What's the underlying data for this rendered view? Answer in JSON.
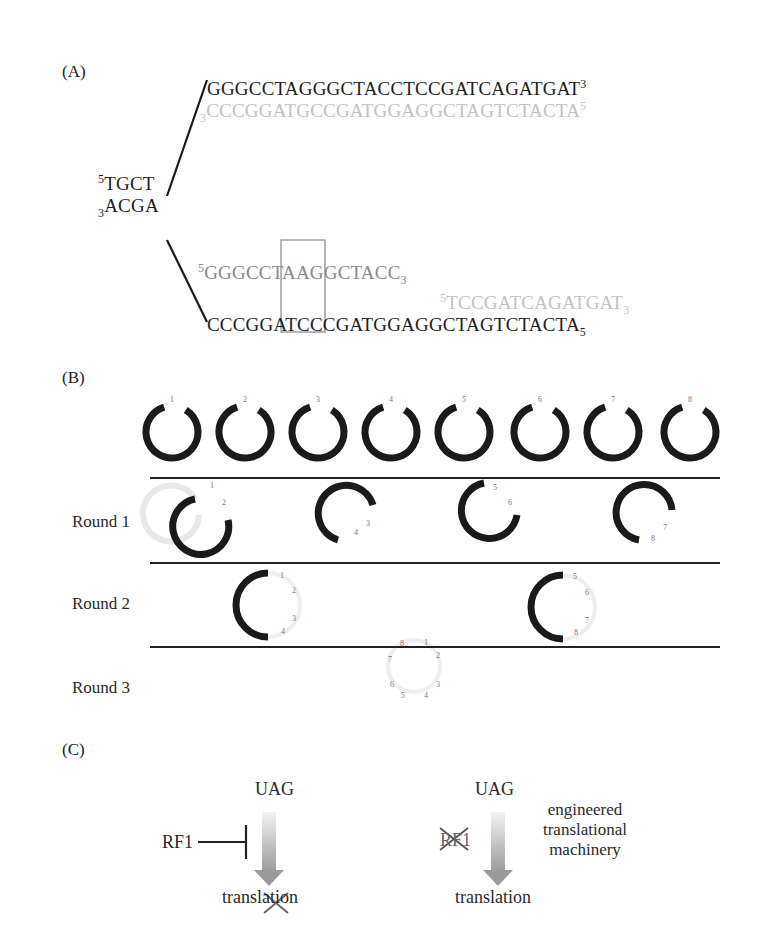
{
  "panels": {
    "a": {
      "label": "(A)",
      "left_end": {
        "top": {
          "prime": "5",
          "seq": "TGCT"
        },
        "bottom": {
          "prime": "3",
          "seq": "ACGA"
        }
      },
      "upper_duplex": {
        "top_strand": {
          "seq": "GGGCCTAGGGCTACCTCCGATCAGATGAT",
          "end_prime": "3",
          "color": "#1e1e1e"
        },
        "bottom_strand": {
          "start_prime": "3",
          "seq": "CCCGGATGCCGATGGAGGCTAGTCTACTA",
          "end_prime": "5",
          "color": "#c2c2c2"
        }
      },
      "lower_duplex": {
        "oligo1": {
          "start_prime": "5",
          "seq": "GGGCCTAAGGCTACC",
          "end_prime": "3",
          "color": "#8a8a8a"
        },
        "oligo2": {
          "start_prime": "5",
          "seq": "TCCGATCAGATGAT",
          "end_prime": "3",
          "color": "#c2c2c2"
        },
        "template": {
          "seq": "CCCGGATCCCGATGGAGGCTAGTCTACTA",
          "end_prime": "5",
          "color": "#1e1e1e"
        },
        "highlight_box": "TAA / ATC"
      }
    },
    "b": {
      "label": "(B)",
      "initial_plasmids": [
        "1",
        "2",
        "3",
        "4",
        "5",
        "6",
        "7",
        "8"
      ],
      "rounds": [
        {
          "label": "Round 1",
          "groups": [
            [
              "1",
              "2"
            ],
            [
              "3",
              "4"
            ],
            [
              "5",
              "6"
            ],
            [
              "7",
              "8"
            ]
          ]
        },
        {
          "label": "Round 2",
          "groups": [
            [
              "1",
              "2",
              "3",
              "4"
            ],
            [
              "5",
              "6",
              "7",
              "8"
            ]
          ]
        },
        {
          "label": "Round 3",
          "groups": [
            [
              "1",
              "2",
              "3",
              "4",
              "5",
              "6",
              "7",
              "8"
            ]
          ]
        }
      ]
    },
    "c": {
      "label": "(C)",
      "left": {
        "codon": "UAG",
        "factor": "RF1",
        "outcome": "translation",
        "outcome_state": "blocked"
      },
      "right": {
        "codon": "UAG",
        "factor": "RF1",
        "factor_state": "deleted",
        "outcome": "translation",
        "note_lines": [
          "engineered",
          "translational",
          "machinery"
        ]
      }
    }
  }
}
